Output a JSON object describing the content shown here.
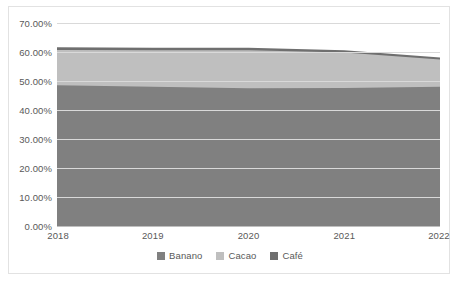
{
  "chart_data": {
    "type": "area",
    "stacked": true,
    "title": "",
    "subtitle": "",
    "xlabel": "",
    "ylabel": "",
    "x": [
      2018,
      2019,
      2020,
      2021,
      2022
    ],
    "categories": [
      "2018",
      "2019",
      "2020",
      "2021",
      "2022"
    ],
    "xtick_labels": [
      "2018",
      "2019",
      "2020",
      "2021",
      "2022"
    ],
    "ytick_labels": [
      "0.00%",
      "10.00%",
      "20.00%",
      "30.00%",
      "40.00%",
      "50.00%",
      "60.00%",
      "70.00%"
    ],
    "ytick_values": [
      0,
      10,
      20,
      30,
      40,
      50,
      60,
      70
    ],
    "ylim": [
      0,
      70
    ],
    "xlim": [
      2018,
      2022
    ],
    "grid": true,
    "grid_axis": "y",
    "legend_position": "bottom",
    "series": [
      {
        "name": "Banano",
        "color": "#808080",
        "values": [
          48.5,
          48.0,
          47.5,
          47.6,
          48.0
        ]
      },
      {
        "name": "Cacao",
        "color": "#bfbfbf",
        "values": [
          12.2,
          12.6,
          13.1,
          12.2,
          9.4
        ]
      },
      {
        "name": "Café",
        "color": "#6f6f6f",
        "values": [
          0.9,
          0.9,
          0.9,
          0.8,
          0.7
        ]
      }
    ],
    "stack_totals": [
      61.6,
      61.5,
      61.5,
      60.6,
      58.1
    ]
  },
  "legend": {
    "items": [
      {
        "label": "Banano",
        "color": "#808080"
      },
      {
        "label": "Cacao",
        "color": "#bfbfbf"
      },
      {
        "label": "Café",
        "color": "#6f6f6f"
      }
    ]
  },
  "colors": {
    "grid": "#d9d9d9",
    "axis": "#bfbfbf",
    "text": "#595959",
    "frame": "#e2e2e2",
    "background": "#ffffff"
  }
}
